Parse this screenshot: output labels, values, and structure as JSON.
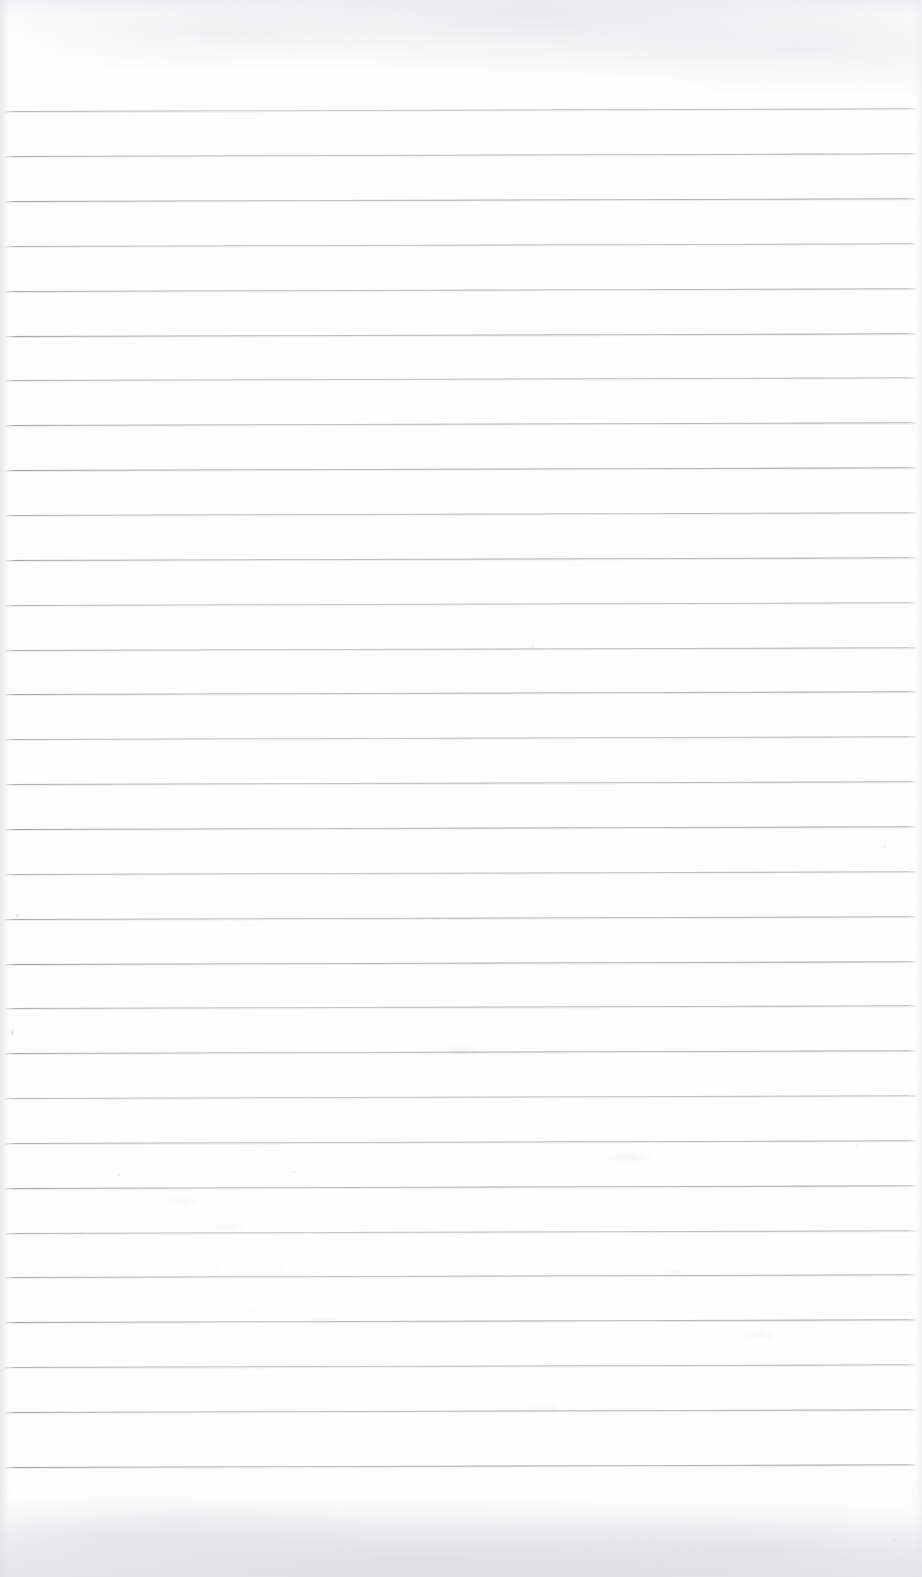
{
  "document": {
    "type": "scanned-lined-paper",
    "title": "",
    "has_text": false,
    "orientation": "portrait",
    "page_width": 922,
    "page_height": 1577,
    "paper_color": "#fdfdfd",
    "background_color": "#ffffff"
  },
  "ruling": {
    "style": "horizontal-ruled",
    "line_color": "#a0a4a9",
    "line_thickness_px": 1,
    "line_spacing_px": 45,
    "first_line_y": 111,
    "last_line_y": 1467,
    "line_start_x": 5,
    "line_end_x": 916,
    "skew_degrees": -0.17,
    "count": 31,
    "line_y_positions": [
      111,
      156,
      201,
      246,
      291,
      336,
      380,
      425,
      470,
      515,
      560,
      605,
      650,
      694,
      739,
      784,
      829,
      874,
      919,
      964,
      1008,
      1053,
      1098,
      1143,
      1188,
      1233,
      1277,
      1322,
      1367,
      1412,
      1467
    ]
  },
  "margins": {
    "top_blank_px": 111,
    "bottom_blank_px": 110,
    "has_margin_rule": false,
    "has_header": false,
    "has_holes": false
  },
  "artifacts": {
    "description": "scan dust specks and faint paper fibers",
    "specks": [
      {
        "x": 16,
        "y": 914,
        "w": 3,
        "h": 3,
        "o": 0.55
      },
      {
        "x": 11,
        "y": 1031,
        "w": 3,
        "h": 4,
        "o": 0.5
      },
      {
        "x": 118,
        "y": 1174,
        "w": 2,
        "h": 2,
        "o": 0.35
      },
      {
        "x": 293,
        "y": 1171,
        "w": 2,
        "h": 2,
        "o": 0.32
      },
      {
        "x": 80,
        "y": 1232,
        "w": 2,
        "h": 2,
        "o": 0.3
      },
      {
        "x": 167,
        "y": 1263,
        "w": 2,
        "h": 2,
        "o": 0.3
      },
      {
        "x": 215,
        "y": 1265,
        "w": 2,
        "h": 2,
        "o": 0.28
      },
      {
        "x": 279,
        "y": 1264,
        "w": 2,
        "h": 2,
        "o": 0.28
      },
      {
        "x": 252,
        "y": 1310,
        "w": 2,
        "h": 2,
        "o": 0.3
      },
      {
        "x": 268,
        "y": 1261,
        "w": 2,
        "h": 2,
        "o": 0.26
      },
      {
        "x": 893,
        "y": 1539,
        "w": 3,
        "h": 3,
        "o": 0.3
      },
      {
        "x": 532,
        "y": 646,
        "w": 2,
        "h": 2,
        "o": 0.25
      },
      {
        "x": 389,
        "y": 803,
        "w": 2,
        "h": 2,
        "o": 0.22
      },
      {
        "x": 884,
        "y": 846,
        "w": 2,
        "h": 2,
        "o": 0.24
      },
      {
        "x": 856,
        "y": 1145,
        "w": 2,
        "h": 2,
        "o": 0.26
      }
    ],
    "smudges": [
      {
        "x": 440,
        "y": 1044,
        "w": 40,
        "h": 12,
        "o": 0.4
      },
      {
        "x": 600,
        "y": 1150,
        "w": 55,
        "h": 14,
        "o": 0.35
      },
      {
        "x": 300,
        "y": 1315,
        "w": 46,
        "h": 12,
        "o": 0.32
      },
      {
        "x": 740,
        "y": 1330,
        "w": 38,
        "h": 11,
        "o": 0.3
      },
      {
        "x": 210,
        "y": 1222,
        "w": 36,
        "h": 10,
        "o": 0.28
      },
      {
        "x": 660,
        "y": 1268,
        "w": 30,
        "h": 10,
        "o": 0.26
      },
      {
        "x": 160,
        "y": 1195,
        "w": 44,
        "h": 12,
        "o": 0.26
      },
      {
        "x": 520,
        "y": 1402,
        "w": 50,
        "h": 13,
        "o": 0.24
      }
    ]
  }
}
